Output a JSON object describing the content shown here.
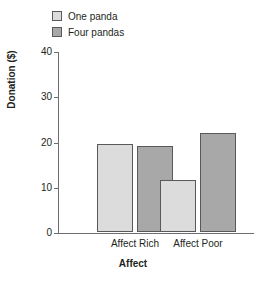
{
  "chart_data": {
    "type": "bar",
    "title": "",
    "subtitle": "",
    "xlabel": "Affect",
    "ylabel": "Donation ($)",
    "categories": [
      "Affect Rich",
      "Affect Poor"
    ],
    "series": [
      {
        "name": "One panda",
        "values": [
          19.5,
          11.5
        ],
        "color": "#dcdcdc"
      },
      {
        "name": "Four pandas",
        "values": [
          19.0,
          21.9
        ],
        "color": "#a8a8a8"
      }
    ],
    "ylim": [
      0,
      40
    ],
    "yticks": [
      0,
      10,
      20,
      30,
      40
    ],
    "ytick_labels": [
      "0",
      "10",
      "20",
      "30",
      "40"
    ],
    "grid": false,
    "legend_position": "top-left",
    "bar_edge_color": "#58595b",
    "axis_color": "#6d6e71"
  },
  "legend": {
    "items": [
      {
        "label": "One panda",
        "swatch_name": "legend-swatch-one-panda"
      },
      {
        "label": "Four pandas",
        "swatch_name": "legend-swatch-four-pandas"
      }
    ]
  },
  "axes": {
    "y_title": "Donation ($)",
    "x_title": "Affect",
    "y_ticks": [
      "40",
      "30",
      "20",
      "10",
      "0"
    ],
    "x_categories": [
      "Affect Rich",
      "Affect Poor"
    ]
  }
}
